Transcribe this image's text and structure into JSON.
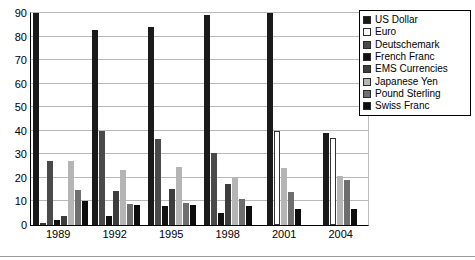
{
  "chart_data": {
    "type": "bar",
    "title": "",
    "xlabel": "",
    "ylabel": "",
    "ylim": [
      0,
      90
    ],
    "yticks": [
      0,
      10,
      20,
      30,
      40,
      50,
      60,
      70,
      80,
      90
    ],
    "grid": true,
    "legend_position": "right",
    "categories": [
      "1989",
      "1992",
      "1995",
      "1998",
      "2001",
      "2004"
    ],
    "series": [
      {
        "name": "US Dollar",
        "color": "#1a1a1a",
        "values": [
          90,
          83,
          84,
          89,
          90,
          39
        ]
      },
      {
        "name": "Euro",
        "color": "#ffffff",
        "values": [
          0.5,
          0,
          0,
          0,
          40,
          37
        ]
      },
      {
        "name": "Deutschemark",
        "color": "#4a4a4a",
        "values": [
          27,
          40,
          36.5,
          30.5,
          0,
          0
        ]
      },
      {
        "name": "French Franc",
        "color": "#111111",
        "values": [
          2,
          4,
          8,
          5,
          0,
          0
        ]
      },
      {
        "name": "EMS Currencies",
        "color": "#3d3d3d",
        "values": [
          4,
          14.5,
          15.5,
          17.5,
          0,
          0
        ]
      },
      {
        "name": "Japanese Yen",
        "color": "#b5b5b5",
        "values": [
          27,
          23.5,
          24.5,
          20.5,
          24,
          21
        ]
      },
      {
        "name": "Pound Sterling",
        "color": "#6e6e6e",
        "values": [
          15,
          9,
          9.5,
          11,
          14,
          19
        ]
      },
      {
        "name": "Swiss Franc",
        "color": "#0d0d0d",
        "values": [
          10,
          8.5,
          8.5,
          8,
          7,
          7
        ]
      }
    ]
  },
  "legend": {
    "items": [
      {
        "label": "US Dollar"
      },
      {
        "label": "Euro"
      },
      {
        "label": "Deutschemark"
      },
      {
        "label": "French Franc"
      },
      {
        "label": "EMS Currencies"
      },
      {
        "label": "Japanese Yen"
      },
      {
        "label": "Pound Sterling"
      },
      {
        "label": "Swiss Franc"
      }
    ]
  }
}
